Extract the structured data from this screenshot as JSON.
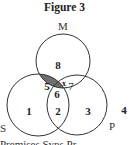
{
  "title": "Figure 3",
  "sets": [
    {
      "name": "M",
      "label": "M"
    },
    {
      "name": "S",
      "label": "S"
    },
    {
      "name": "P",
      "label": "P"
    }
  ],
  "regions": {
    "M_only": "8",
    "S_only": "1",
    "P_only": "3",
    "M_and_S_only": "5",
    "M_and_P_only": "7",
    "M_and_P_only_mark": "x",
    "S_and_P_only": "2",
    "M_S_P": "6",
    "outside": "4"
  },
  "shaded_regions": [
    "M_and_S_only",
    "M_S_P"
  ],
  "colors": {
    "shade": "#6e6e6e",
    "stroke": "#333333",
    "background": "#ffffff"
  },
  "bottom_caption_partial": "Premises   Syns   Pr"
}
